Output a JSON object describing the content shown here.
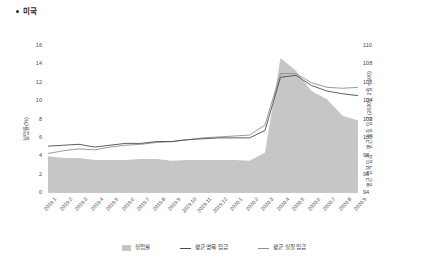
{
  "title": {
    "bullet": "•",
    "text": "미국"
  },
  "axes": {
    "left": {
      "label": "실업률(%)",
      "ticks": [
        16,
        14,
        12,
        10,
        8,
        6,
        4,
        2,
        0
      ],
      "min": 0,
      "max": 16
    },
    "right": {
      "label": "평균 명목 임금 · 평균 실질 임금 (2020년 2월 = 100)",
      "ticks": [
        110,
        108,
        106,
        104,
        102,
        100,
        98,
        96,
        94
      ],
      "min": 94,
      "max": 110
    }
  },
  "legend": [
    {
      "name": "unemployment",
      "label": "실업률",
      "type": "area",
      "color": "#c6c6c6"
    },
    {
      "name": "nominal-wage",
      "label": "평균 명목 임금",
      "type": "line",
      "color": "#4d4d4d"
    },
    {
      "name": "real-wage",
      "label": "평균 실질 임금",
      "type": "line",
      "color": "#8d8d8d"
    }
  ],
  "chart_data": {
    "type": "area",
    "title": "미국",
    "xlabel": "",
    "ylabel": "실업률(%)",
    "ylabel_right": "평균 명목 임금 · 평균 실질 임금 (2020년 2월 = 100)",
    "ylim": [
      0,
      16
    ],
    "ylim_right": [
      94,
      110
    ],
    "grid": false,
    "legend_position": "bottom",
    "categories": [
      "2019.1",
      "2019.2",
      "2019.3",
      "2019.4",
      "2019.5",
      "2019.6",
      "2019.7",
      "2019.8",
      "2019.9",
      "2019.10",
      "2019.11",
      "2019.12",
      "2020.1",
      "2020.2",
      "2020.3",
      "2020.4",
      "2020.5",
      "2020.6",
      "2020.7",
      "2020.8",
      "2020.9"
    ],
    "series": [
      {
        "name": "실업률",
        "axis": "left",
        "type": "area",
        "color": "#c6c6c6",
        "values": [
          4.0,
          3.8,
          3.8,
          3.6,
          3.6,
          3.6,
          3.7,
          3.7,
          3.5,
          3.6,
          3.6,
          3.6,
          3.6,
          3.5,
          4.4,
          14.7,
          13.3,
          11.1,
          10.2,
          8.4,
          7.9
        ]
      },
      {
        "name": "평균 명목 임금",
        "axis": "right",
        "type": "line",
        "color": "#4d4d4d",
        "values": [
          99.1,
          99.2,
          99.3,
          99.0,
          99.2,
          99.4,
          99.4,
          99.6,
          99.6,
          99.8,
          99.9,
          100.0,
          100.0,
          100.0,
          100.8,
          106.6,
          106.8,
          105.7,
          105.1,
          104.8,
          104.6
        ]
      },
      {
        "name": "평균 실질 임금",
        "axis": "right",
        "type": "line",
        "color": "#8d8d8d",
        "values": [
          98.3,
          98.6,
          98.8,
          98.7,
          99.0,
          99.2,
          99.3,
          99.5,
          99.6,
          99.8,
          100.0,
          100.1,
          100.2,
          100.3,
          101.4,
          107.0,
          107.0,
          106.0,
          105.5,
          105.4,
          105.5
        ]
      }
    ]
  }
}
